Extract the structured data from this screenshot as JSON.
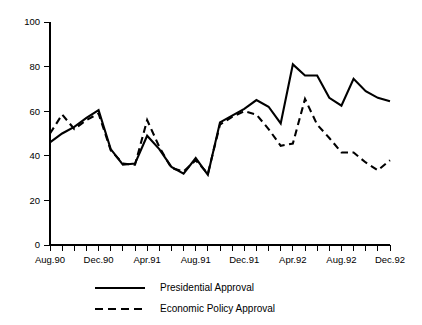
{
  "chart_data": {
    "type": "line",
    "title": "",
    "subtitle": "",
    "xlabel": "",
    "ylabel": "",
    "ylim": [
      0,
      100
    ],
    "yticks": [
      0,
      20,
      40,
      60,
      80,
      100
    ],
    "grid": false,
    "legend_position": "bottom",
    "x": [
      "Aug.90",
      "Sep.90",
      "Oct.90",
      "Nov.90",
      "Dec.90",
      "Jan.91",
      "Feb.91",
      "Mar.91",
      "Apr.91",
      "May.91",
      "Jun.91",
      "Jul.91",
      "Aug.91",
      "Sep.91",
      "Oct.91",
      "Nov.91",
      "Dec.91",
      "Jan.92",
      "Feb.92",
      "Mar.92",
      "Apr.92",
      "May.92",
      "Jun.92",
      "Jul.92",
      "Aug.92",
      "Sep.92",
      "Oct.92",
      "Nov.92",
      "Dec.92"
    ],
    "xticks_labeled": [
      "Aug.90",
      "Dec.90",
      "Apr.91",
      "Aug.91",
      "Dec.91",
      "Apr.92",
      "Aug.92",
      "Dec.92"
    ],
    "series": [
      {
        "name": "Presidential Approval",
        "style": "solid",
        "color": "#000000",
        "values": [
          46,
          50,
          53,
          57,
          60.5,
          43,
          36,
          36.5,
          49,
          43,
          35,
          32,
          39,
          31.5,
          55,
          58,
          61,
          65,
          62,
          54.5,
          81,
          76,
          76,
          66,
          62.5,
          74.5,
          69,
          66,
          64.5
        ]
      },
      {
        "name": "Economic Policy Approval",
        "style": "dashed",
        "color": "#000000",
        "values": [
          50,
          58.5,
          52,
          56,
          59,
          42.5,
          36.5,
          36,
          56,
          44,
          34.5,
          33,
          38,
          32,
          54,
          57.5,
          60,
          58.5,
          52,
          44.5,
          45.5,
          65.5,
          54,
          48,
          41.5,
          41.5,
          37,
          33.5,
          38
        ]
      }
    ]
  },
  "legend": {
    "items": [
      {
        "label": "Presidential Approval",
        "style": "solid"
      },
      {
        "label": "Economic Policy Approval",
        "style": "dashed"
      }
    ]
  }
}
